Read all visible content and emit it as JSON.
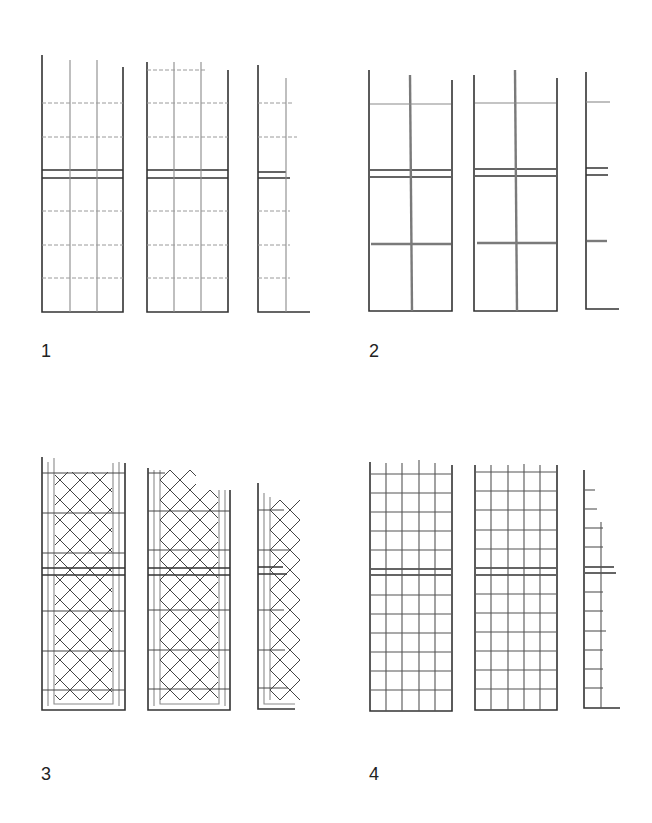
{
  "figure": {
    "type": "trellis panel pattern diagram",
    "panels": [
      {
        "id": "1",
        "label": "1",
        "pattern": "3 vertical posts, dashed horizontal rails, wide transom",
        "columns": 3
      },
      {
        "id": "2",
        "label": "2",
        "pattern": "single central vertical, two horizontal rails, transom",
        "columns": 3
      },
      {
        "id": "3",
        "label": "3",
        "pattern": "diagonal lattice within framed border",
        "columns": 3
      },
      {
        "id": "4",
        "label": "4",
        "pattern": "dense square grid, 5 columns",
        "columns": 3
      }
    ]
  },
  "colors": {
    "background": "#ffffff",
    "frame": "#333333",
    "grid": "#8a8a8a"
  }
}
